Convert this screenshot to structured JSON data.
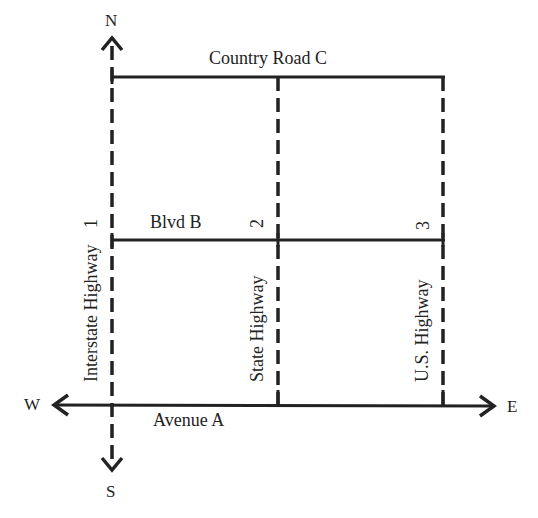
{
  "map": {
    "line_color": "#222222",
    "compass": {
      "north": "N",
      "south": "S",
      "west": "W",
      "east": "E"
    },
    "roads": {
      "avenue_a": "Avenue A",
      "blvd_b": "Blvd B",
      "country_road_c": "Country Road C",
      "interstate": "Interstate Highway",
      "state": "State Highway",
      "us": "U.S. Highway"
    },
    "highway_numbers": {
      "interstate": "1",
      "state": "2",
      "us": "3"
    }
  }
}
